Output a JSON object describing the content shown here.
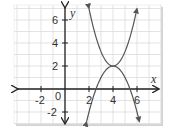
{
  "chart_data": {
    "type": "line",
    "title": "",
    "xlabel": "x",
    "ylabel": "y",
    "xlim": [
      -4,
      8
    ],
    "ylim": [
      -3,
      7
    ],
    "grid": true,
    "x_ticks": [
      -2,
      2,
      4,
      6
    ],
    "y_ticks": [
      -2,
      2,
      4,
      6
    ],
    "origin_label": "0",
    "series": [
      {
        "name": "upper parabola",
        "equation": "y = 1.25(x-4)^2 + 2",
        "vertex": [
          4,
          2
        ],
        "opens": "up",
        "x_range": [
          2,
          6
        ],
        "points": [
          [
            2,
            7
          ],
          [
            3,
            3.25
          ],
          [
            4,
            2
          ],
          [
            5,
            3.25
          ],
          [
            6,
            7
          ]
        ]
      },
      {
        "name": "lower parabola",
        "equation": "y = -(x-4)^2 + 2",
        "vertex": [
          4,
          2
        ],
        "opens": "down",
        "x_range": [
          1.8,
          6.2
        ],
        "points": [
          [
            1.8,
            -2.84
          ],
          [
            2,
            -2
          ],
          [
            3,
            1
          ],
          [
            4,
            2
          ],
          [
            5,
            1
          ],
          [
            6,
            -2
          ],
          [
            6.2,
            -2.84
          ]
        ]
      }
    ],
    "legend": null
  },
  "labels": {
    "x_axis": "x",
    "y_axis": "y",
    "origin": "0",
    "x_ticks": [
      "-2",
      "2",
      "4",
      "6"
    ],
    "y_ticks": [
      "6",
      "4",
      "2",
      "-2"
    ]
  },
  "colors": {
    "grid": "#dcdcdc",
    "axis": "#222222",
    "curve": "#555555",
    "background": "#ffffff",
    "shadow": "#cfcfcf"
  }
}
